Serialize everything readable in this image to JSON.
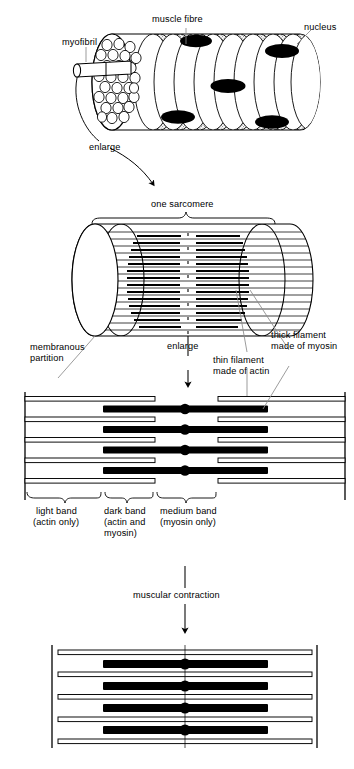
{
  "figure": {
    "title_caption": "",
    "type": "biological-diagram"
  },
  "colors": {
    "ink": "#000000",
    "paper": "#ffffff",
    "stipple": "#b9b9b9",
    "leader": "#8a8a8a",
    "filament_dark": "#000000",
    "filament_light_fill": "#ffffff"
  },
  "panels": [
    {
      "id": "muscle-fibre",
      "name": "muscle fibre panel",
      "labels": [
        {
          "key": "myofibril",
          "text": "myofibril"
        },
        {
          "key": "muscle_fibre",
          "text": "muscle fibre"
        },
        {
          "key": "nucleus",
          "text": "nucleus"
        }
      ]
    },
    {
      "id": "sarcomere",
      "name": "sarcomere panel",
      "labels": [
        {
          "key": "one_sarcomere",
          "text": "one sarcomere"
        },
        {
          "key": "membranous_partition",
          "text": "membranous\npartition"
        },
        {
          "key": "thin_filament",
          "text": "thin filament\nmade of actin"
        },
        {
          "key": "thick_filament",
          "text": "thick filament\nmade of myosin"
        }
      ]
    },
    {
      "id": "filaments-relaxed",
      "name": "relaxed filament array panel",
      "labels": [
        {
          "key": "light_band",
          "text": "light band\n(actin only)"
        },
        {
          "key": "dark_band",
          "text": "dark band\n(actin and\nmyosin)"
        },
        {
          "key": "medium_band",
          "text": "medium band\n(myosin only)"
        }
      ]
    },
    {
      "id": "filaments-contracted",
      "name": "contracted filament array panel",
      "labels": []
    }
  ],
  "connectors": [
    {
      "key": "enlarge_1",
      "text": "enlarge",
      "style": "curved-arrow"
    },
    {
      "key": "enlarge_2",
      "text": "enlarge",
      "style": "straight-arrow"
    },
    {
      "key": "muscular_contraction",
      "text": "muscular contraction",
      "style": "straight-arrow"
    }
  ],
  "labels": {
    "myofibril": "myofibril",
    "muscle_fibre": "muscle fibre",
    "nucleus": "nucleus",
    "enlarge_1": "enlarge",
    "one_sarcomere": "one sarcomere",
    "membranous_partition_l1": "membranous",
    "membranous_partition_l2": "partition",
    "enlarge_2": "enlarge",
    "thin_filament_l1": "thin filament",
    "thin_filament_l2": "made of actin",
    "thick_filament_l1": "thick filament",
    "thick_filament_l2": "made of myosin",
    "light_band_l1": "light band",
    "light_band_l2": "(actin only)",
    "dark_band_l1": "dark band",
    "dark_band_l2": "(actin and",
    "dark_band_l3": "myosin)",
    "medium_band_l1": "medium band",
    "medium_band_l2": "(myosin only)",
    "muscular_contraction": "muscular contraction"
  },
  "diagram_data": {
    "relaxed": {
      "frame": {
        "left": 25,
        "right": 345,
        "top": 392,
        "bottom": 500
      },
      "thin_filament_rows_y": [
        399,
        419,
        440,
        460,
        481
      ],
      "thin_left_span": [
        62,
        155
      ],
      "thin_right_span": [
        218,
        352
      ],
      "thick_filament_rows_y": [
        409,
        430,
        450,
        471
      ],
      "thick_span": [
        103,
        268
      ],
      "thick_thickness": 7,
      "node_x": 185,
      "node_r": 5.2,
      "bands": {
        "light_band_span": [
          25,
          103
        ],
        "dark_band_span": [
          103,
          155
        ],
        "medium_band_span": [
          155,
          218
        ]
      }
    },
    "contracted": {
      "frame": {
        "left": 52,
        "right": 317,
        "top": 645,
        "bottom": 748
      },
      "thin_filament_rows_y": [
        652,
        674,
        697,
        719,
        741
      ],
      "thin_span": [
        58,
        312
      ],
      "thick_filament_rows_y": [
        664,
        686,
        708,
        730
      ],
      "thick_span": [
        103,
        268
      ],
      "thick_thickness": 8,
      "node_x": 185,
      "node_r": 5.6
    },
    "muscle_fibre_cylinder": {
      "nuclei_count": 5,
      "myofibril_circles_count": 28
    }
  }
}
